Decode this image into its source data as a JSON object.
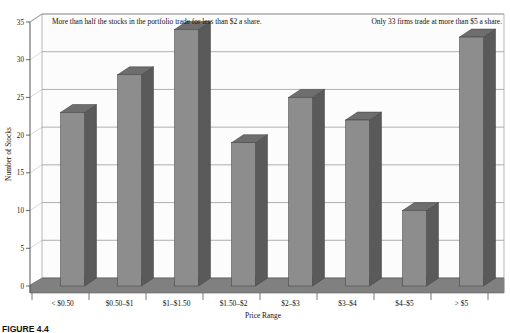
{
  "chart_data": {
    "type": "bar",
    "title": "",
    "subtitle": "",
    "xlabel": "Price Range",
    "ylabel": "Number of Stocks",
    "categories": [
      "< $0.50",
      "$0.50–$1",
      "$1–$1.50",
      "$1.50–$2",
      "$2–$3",
      "$3–$4",
      "$4–$5",
      "> $5"
    ],
    "values": [
      23,
      28,
      34,
      19,
      25,
      22,
      10,
      33
    ],
    "ylim": [
      0,
      35
    ],
    "ytick_step": 5,
    "yticks": [
      "0",
      "5",
      "10",
      "15",
      "20",
      "25",
      "30",
      "35"
    ],
    "grid": true,
    "legend": "none",
    "style": "3d-column",
    "annotations": [
      {
        "id": "left-note",
        "text": "More than half the stocks in the portfolio trade for less than $2 a share."
      },
      {
        "id": "right-note",
        "text": "Only 33 firms trade at more than $5 a share."
      }
    ],
    "colors": {
      "bar_front": "#8d8d8d",
      "bar_side": "#5a5a5a",
      "bar_top": "#6e6e6e",
      "plot_background": "#fcfcfc",
      "floor": "#808080",
      "grid": "#7a7a7a",
      "axis": "#555555",
      "text": "#111111"
    }
  },
  "caption": {
    "label": "FIGURE 4.4"
  }
}
